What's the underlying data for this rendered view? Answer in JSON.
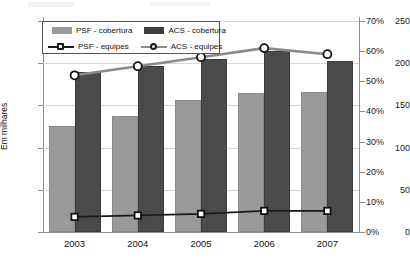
{
  "chart": {
    "type": "bar-line-combo",
    "ylabel_left": "Em milhares",
    "axis_left_ticks": [
      "0",
      "50",
      "100",
      "150",
      "200",
      "250"
    ],
    "axis_right_ticks": [
      "0%",
      "10%",
      "20%",
      "30%",
      "40%",
      "50%",
      "60%",
      "70%"
    ],
    "categories": [
      "2003",
      "2004",
      "2005",
      "2006",
      "2007"
    ]
  },
  "legend": {
    "items": [
      {
        "label": "PSF - cobertura",
        "kind": "bar",
        "color": "#9a9a9a"
      },
      {
        "label": "ACS - cobertura",
        "kind": "bar",
        "color": "#3d3d3d"
      },
      {
        "label": "PSF - equipes",
        "kind": "line",
        "color": "#1a1a1a"
      },
      {
        "label": "ACS - equipes",
        "kind": "line",
        "color": "#8a8a8a"
      }
    ]
  },
  "chart_data": {
    "type": "bar",
    "title": "",
    "subtitle": "",
    "xlabel": "",
    "ylabel": "Em milhares",
    "ylabel_secondary": "",
    "categories": [
      "2003",
      "2004",
      "2005",
      "2006",
      "2007"
    ],
    "ylim": [
      0,
      250
    ],
    "ylim_secondary": [
      0,
      70
    ],
    "yticks": [
      0,
      50,
      100,
      150,
      200,
      250
    ],
    "yticks_secondary": [
      0,
      10,
      20,
      30,
      40,
      50,
      60,
      70
    ],
    "grid": true,
    "legend_position": "top-left",
    "series": [
      {
        "name": "PSF - cobertura",
        "type": "bar",
        "axis": "left",
        "color": "#9a9a9a",
        "values": [
          126,
          138,
          157,
          165,
          166
        ]
      },
      {
        "name": "ACS - cobertura",
        "type": "bar",
        "axis": "left",
        "color": "#3d3d3d",
        "values": [
          190,
          197,
          205,
          214,
          203
        ]
      },
      {
        "name": "PSF - equipes",
        "type": "line",
        "axis": "right",
        "color": "#1a1a1a",
        "values": [
          5,
          5.5,
          6,
          7,
          7
        ]
      },
      {
        "name": "ACS - equipes",
        "type": "line",
        "axis": "right",
        "color": "#8a8a8a",
        "values": [
          52,
          55,
          58,
          61,
          59
        ]
      }
    ]
  }
}
